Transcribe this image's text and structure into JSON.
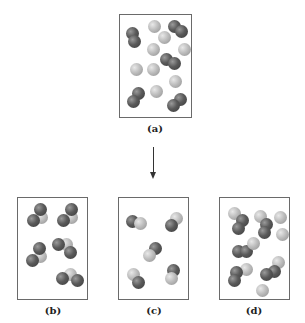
{
  "figure": {
    "panels": [
      {
        "id": "a",
        "label": "(a)",
        "description": "Mixture of diatomic dark molecules and single light atoms (reactants)"
      },
      {
        "id": "b",
        "label": "(b)",
        "description": "Triatomic molecules: two dark atoms bonded to one light atom"
      },
      {
        "id": "c",
        "label": "(c)",
        "description": "Diatomic molecules: one dark atom bonded to one light atom"
      },
      {
        "id": "d",
        "label": "(d)",
        "description": "Mixture of diatomic molecules, triatomic molecules and light atoms"
      }
    ],
    "arrow": {
      "direction": "down",
      "meaning": "reaction"
    },
    "colors": {
      "dark_atom": "#4a4a4a",
      "light_atom": "#bdbdbd",
      "border": "#6a6a6a"
    }
  }
}
